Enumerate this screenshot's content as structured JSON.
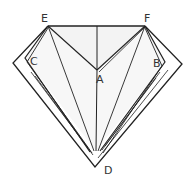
{
  "diagram": {
    "type": "geometric-figure",
    "labels": {
      "E": "E",
      "F": "F",
      "A": "A",
      "B": "B",
      "C": "C",
      "D": "D"
    },
    "colors": {
      "line": "#222222",
      "fill_top": "#f2f2f2",
      "label": "#333333"
    }
  }
}
